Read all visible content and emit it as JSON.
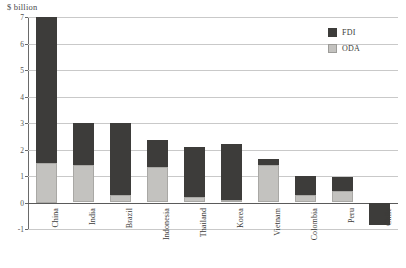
{
  "axis_unit_label": "$ billion",
  "legend": {
    "position": "top-right",
    "entries": [
      {
        "label": "FDI",
        "color": "#3d3c3a",
        "key": "fdi"
      },
      {
        "label": "ODA",
        "color": "#c3c2bf",
        "key": "oda"
      }
    ]
  },
  "colors": {
    "fdi": "#3d3c3a",
    "oda": "#c3c2bf",
    "gridline": "#c9c9c9",
    "axis": "#6a6a6a",
    "text": "#3c3b39",
    "background": "#ffffff"
  },
  "caption": "",
  "chart_data": {
    "type": "bar",
    "stacked": true,
    "title": "",
    "subtitle": "",
    "xlabel": "",
    "ylabel": "$ billion",
    "ylim": [
      -1,
      7
    ],
    "yticks": [
      7,
      6,
      5,
      4,
      3,
      2,
      1,
      0,
      -1
    ],
    "ytick_labels": [
      "7",
      "6",
      "5",
      "4",
      "3",
      "2",
      "1",
      "0",
      "-1"
    ],
    "grid": true,
    "legend_position": "top right",
    "categories": [
      "China",
      "India",
      "Brazil",
      "Indonesia",
      "Thailand",
      "Korea",
      "Vietnam",
      "Colombia",
      "Peru",
      "Chile"
    ],
    "series": [
      {
        "name": "ODA",
        "color": "#c3c2bf",
        "values": [
          1.5,
          1.4,
          0.3,
          1.35,
          0.2,
          0.1,
          1.4,
          0.3,
          0.45,
          0
        ]
      },
      {
        "name": "FDI",
        "color": "#3d3c3a",
        "values": [
          5.5,
          1.6,
          2.7,
          1.0,
          1.9,
          2.1,
          0.25,
          0.7,
          0.5,
          -0.85
        ]
      }
    ],
    "totals": [
      7.0,
      3.0,
      3.0,
      2.35,
      2.1,
      2.2,
      1.65,
      1.0,
      0.95,
      -0.85
    ]
  }
}
